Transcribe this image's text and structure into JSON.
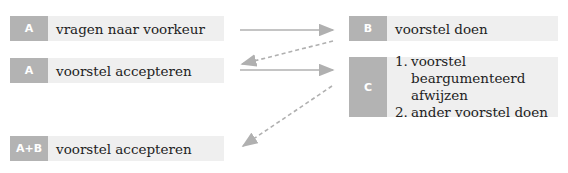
{
  "diagram": {
    "boxes": [
      {
        "id": "a1",
        "tag": "A",
        "text": "vragen naar voorkeur"
      },
      {
        "id": "a2",
        "tag": "A",
        "text": "voorstel accepteren"
      },
      {
        "id": "b",
        "tag": "B",
        "text": "voorstel doen"
      },
      {
        "id": "c",
        "tag": "C",
        "items": [
          {
            "num": "1.",
            "text": "voorstel beargumenteerd afwijzen"
          },
          {
            "num": "2.",
            "text": "ander voorstel doen"
          }
        ]
      },
      {
        "id": "ab",
        "tag": "A+B",
        "text": "voorstel accepteren"
      }
    ],
    "arrows": [
      {
        "from": "a1",
        "to": "b",
        "style": "solid"
      },
      {
        "from": "b",
        "to": "a2",
        "style": "dashed"
      },
      {
        "from": "a2",
        "to": "c",
        "style": "solid"
      },
      {
        "from": "c",
        "to": "ab",
        "style": "dashed"
      }
    ],
    "colors": {
      "tag_bg": "#b3b3b3",
      "box_bg": "#efefef",
      "arrow": "#b0b0b0"
    }
  }
}
